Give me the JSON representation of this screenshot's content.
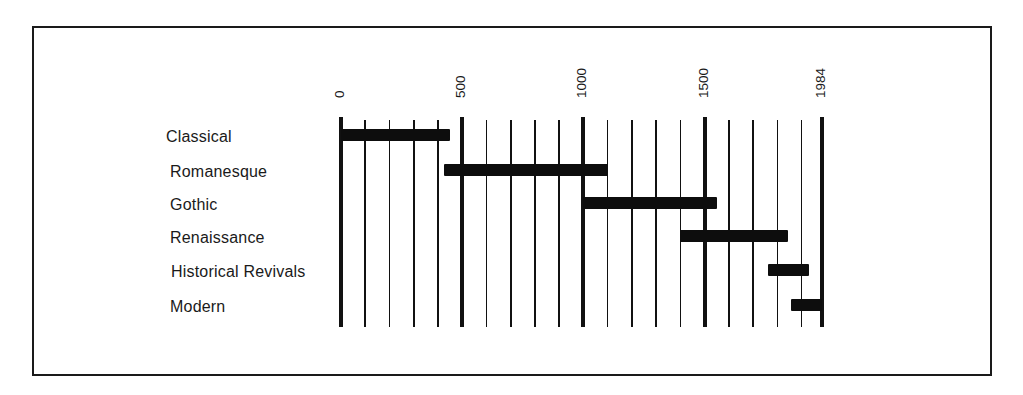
{
  "chart_data": {
    "type": "bar",
    "subtype": "horizontal-timeline",
    "title": "",
    "xlabel": "",
    "ylabel": "",
    "xlim": [
      0,
      1984
    ],
    "grid": true,
    "grid_interval": 100,
    "major_ticks": [
      0,
      500,
      1000,
      1500,
      1984
    ],
    "tick_labels": [
      "0",
      "500",
      "1000",
      "1500",
      "1984"
    ],
    "categories": [
      "Classical",
      "Romanesque",
      "Gothic",
      "Renaissance",
      "Historical Revivals",
      "Modern"
    ],
    "series": [
      {
        "name": "Period span (years)",
        "ranges": [
          {
            "label": "Classical",
            "start": 0,
            "end": 450
          },
          {
            "label": "Romanesque",
            "start": 425,
            "end": 1100
          },
          {
            "label": "Gothic",
            "start": 1000,
            "end": 1550
          },
          {
            "label": "Renaissance",
            "start": 1400,
            "end": 1845
          },
          {
            "label": "Historical Revivals",
            "start": 1760,
            "end": 1930
          },
          {
            "label": "Modern",
            "start": 1855,
            "end": 1984
          }
        ]
      }
    ],
    "legend": "none"
  },
  "colors": {
    "bar": "#0d0d0d",
    "grid": "#111111",
    "background": "#ffffff"
  }
}
